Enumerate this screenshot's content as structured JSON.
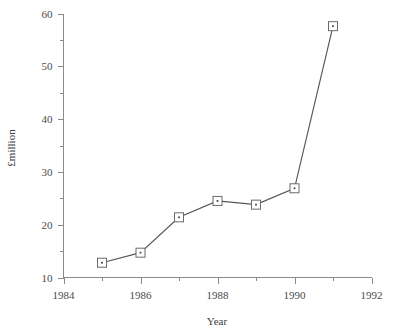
{
  "chart_data": {
    "type": "line",
    "title": "",
    "xlabel": "Year",
    "ylabel": "£million",
    "xlim": [
      1984,
      1992
    ],
    "ylim": [
      10,
      60
    ],
    "grid": false,
    "legend": null,
    "x": [
      1985,
      1986,
      1987,
      1988,
      1989,
      1990,
      1991
    ],
    "values": [
      12.8,
      14.7,
      21.4,
      24.5,
      23.8,
      26.9,
      57.6
    ],
    "series": [
      {
        "name": "£million",
        "x": [
          1985,
          1986,
          1987,
          1988,
          1989,
          1990,
          1991
        ],
        "values": [
          12.8,
          14.7,
          21.4,
          24.5,
          23.8,
          26.9,
          57.6
        ]
      }
    ],
    "x_tick_labels": [
      "1984",
      "1986",
      "1988",
      "1990",
      "1992"
    ],
    "x_tick_values": [
      1984,
      1986,
      1988,
      1990,
      1992
    ],
    "x_minor_tick_values": [
      1985,
      1987,
      1989,
      1991
    ],
    "y_tick_labels": [
      "60",
      "50",
      "40",
      "30",
      "20",
      "10"
    ],
    "y_tick_values": [
      60,
      50,
      40,
      30,
      20,
      10
    ],
    "y_minor_tick_values": [
      15,
      25,
      35,
      45,
      55
    ],
    "marker_style": "open-square-with-center-dot",
    "colors": {
      "line": "#55555c",
      "marker_fill": "#ffffff",
      "marker_stroke": "#6a6a70",
      "axis": "#8a8a8a",
      "text": "#4a4a4a",
      "background": "#ffffff"
    }
  },
  "axes": {
    "x_title": "Year",
    "y_title": "£million"
  },
  "y_ticks": [
    {
      "label": "60",
      "value": 60
    },
    {
      "label": "50",
      "value": 50
    },
    {
      "label": "40",
      "value": 40
    },
    {
      "label": "30",
      "value": 30
    },
    {
      "label": "20",
      "value": 20
    },
    {
      "label": "10",
      "value": 10
    }
  ],
  "x_ticks": [
    {
      "label": "1984",
      "value": 1984
    },
    {
      "label": "1986",
      "value": 1986
    },
    {
      "label": "1988",
      "value": 1988
    },
    {
      "label": "1990",
      "value": 1990
    },
    {
      "label": "1992",
      "value": 1992
    }
  ]
}
